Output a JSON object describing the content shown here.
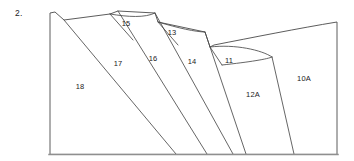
{
  "figure": {
    "number_label": "2.",
    "type": "geologic-cross-section",
    "stroke_color": "#4a4a4a",
    "base_color": "#8f8f8f",
    "background_color": "#ffffff"
  },
  "units": [
    {
      "id": "unit-18",
      "label": "18",
      "x": 80,
      "y": 89
    },
    {
      "id": "unit-17",
      "label": "17",
      "x": 118,
      "y": 66
    },
    {
      "id": "unit-15",
      "label": "15",
      "x": 126,
      "y": 26
    },
    {
      "id": "unit-16",
      "label": "16",
      "x": 153,
      "y": 61
    },
    {
      "id": "unit-13",
      "label": "13",
      "x": 172,
      "y": 35
    },
    {
      "id": "unit-14",
      "label": "14",
      "x": 192,
      "y": 64
    },
    {
      "id": "unit-11",
      "label": "11",
      "x": 229,
      "y": 63
    },
    {
      "id": "unit-12A",
      "label": "12A",
      "x": 253,
      "y": 97
    },
    {
      "id": "unit-10A",
      "label": "10A",
      "x": 304,
      "y": 81
    }
  ],
  "geometry": {
    "outline": "M 50,154 L 50,13 L 55,12 L 64,20 L 110,14 L 118,11 L 155,13 L 158,22 L 205,32 L 210,47 L 214,45 C 250,38 300,28 337,22 L 337,154 Z",
    "bed_lines": [
      {
        "id": "bed-18-17",
        "d": "M 64,20 L 176,154"
      },
      {
        "id": "bed-17-16",
        "d": "M 118,11 L 207,154"
      },
      {
        "id": "bed-15-lower",
        "d": "M 110,14 L 133,40"
      },
      {
        "id": "bed-16-14",
        "d": "M 155,13 L 233,154"
      },
      {
        "id": "bed-13-lower",
        "d": "M 158,22 L 178,45"
      },
      {
        "id": "bed-14-11",
        "d": "M 205,32 L 246,154"
      },
      {
        "id": "bed-11-lower",
        "d": "M 210,47 L 222,65"
      },
      {
        "id": "bed-11-12A",
        "d": "M 222,65 C 250,62 268,59 272,57"
      },
      {
        "id": "bed-12A-10A",
        "d": "M 272,57 L 294,154"
      }
    ],
    "arc_lines": [
      {
        "id": "arc-15-top",
        "d": "M 110,14 C 128,17 145,18 155,13"
      },
      {
        "id": "arc-13-top",
        "d": "M 158,22 C 178,28 196,32 205,32"
      },
      {
        "id": "arc-11-top",
        "d": "M 210,47 C 235,44 262,50 272,57"
      }
    ],
    "baseline": {
      "id": "ground-line",
      "d": "M 49,154.5 L 338,154.5"
    }
  }
}
